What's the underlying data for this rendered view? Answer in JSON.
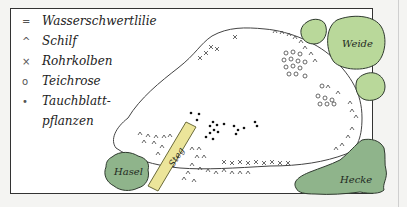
{
  "legend": [
    {
      "symbol": "=",
      "label": "Wasserschwertlilie",
      "icon": "double-line-icon"
    },
    {
      "symbol": "^",
      "label": "Schilf",
      "icon": "caret-icon"
    },
    {
      "symbol": "×",
      "label": "Rohrkolben",
      "icon": "cross-icon"
    },
    {
      "symbol": "o",
      "label": "Teichrose",
      "icon": "circle-icon"
    },
    {
      "symbol": "•",
      "label": "Tauchblatt-",
      "icon": "dot-icon"
    },
    {
      "symbol": "",
      "label": "pflanzen",
      "icon": ""
    }
  ],
  "areas": {
    "weide": "Weide",
    "hasel": "Hasel",
    "hecke": "Hecke",
    "steg": "Steg"
  },
  "colors": {
    "light_green": "#b9d89a",
    "dark_green": "#8fb48b",
    "steg_yellow": "#ece59a",
    "outline": "#2f3a2f"
  }
}
